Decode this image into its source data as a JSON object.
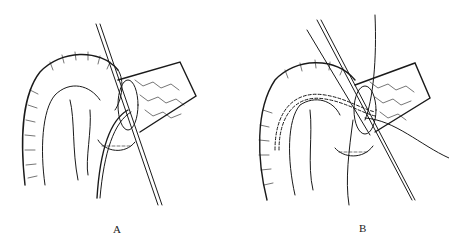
{
  "figure": {
    "panels": [
      {
        "id": "A",
        "label": "A",
        "elements": [
          "jejunal-loop",
          "pancreas-stump",
          "stent-tube",
          "stay-sutures",
          "anastomosis-sutures"
        ]
      },
      {
        "id": "B",
        "label": "B",
        "elements": [
          "jejunal-loop",
          "pancreas-stump",
          "internal-stent-dashed",
          "stay-sutures",
          "free-suture-threads",
          "anastomosis-sutures"
        ]
      }
    ],
    "colors": {
      "ink": "#1a1a1a",
      "background": "#ffffff"
    }
  }
}
